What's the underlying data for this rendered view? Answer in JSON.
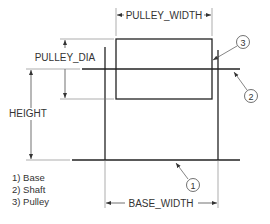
{
  "diagram": {
    "type": "engineering dimension drawing",
    "dimensions": {
      "pulley_width": "PULLEY_WIDTH",
      "pulley_dia": "PULLEY_DIA",
      "height": "HEIGHT",
      "base_width": "BASE_WIDTH"
    },
    "callouts": [
      {
        "number": "1",
        "target": "base"
      },
      {
        "number": "2",
        "target": "shaft"
      },
      {
        "number": "3",
        "target": "pulley"
      }
    ],
    "legend": [
      {
        "label": "1) Base"
      },
      {
        "label": "2) Shaft"
      },
      {
        "label": "3) Pulley"
      }
    ],
    "colors": {
      "line": "#222222",
      "thin_line": "#555555",
      "text": "#333333",
      "background": "#ffffff"
    }
  }
}
